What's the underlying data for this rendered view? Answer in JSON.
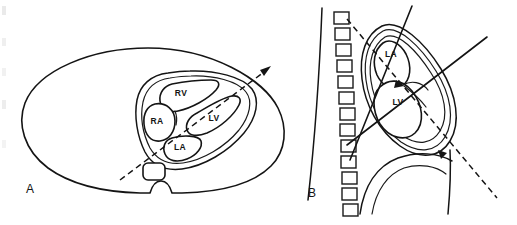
{
  "figure": {
    "width": 517,
    "height": 225,
    "background": "#ffffff",
    "ink_color": "#141414"
  },
  "panels": [
    {
      "id": "A",
      "label": "A",
      "label_x": 30,
      "label_y": 190,
      "view": "transverse thoracic cross-section",
      "chambers": [
        {
          "abbr": "RV",
          "x": 181,
          "y": 94
        },
        {
          "abbr": "RA",
          "x": 157,
          "y": 122
        },
        {
          "abbr": "LV",
          "x": 214,
          "y": 119
        },
        {
          "abbr": "LA",
          "x": 180,
          "y": 148
        }
      ],
      "structures": [
        "body-wall-outline",
        "pericardial-outline",
        "descending-aorta",
        "spine-notch"
      ],
      "scan_plane": {
        "type": "dashed",
        "from_x": 120,
        "from_y": 180,
        "to_x": 272,
        "to_y": 66,
        "has_arrowhead": true
      }
    },
    {
      "id": "B",
      "label": "B",
      "label_x": 312,
      "label_y": 194,
      "view": "sagittal / parasternal long-axis",
      "chambers": [
        {
          "abbr": "LA",
          "x": 391,
          "y": 55
        },
        {
          "abbr": "LV",
          "x": 398,
          "y": 103
        }
      ],
      "structures": [
        "chest-wall-line",
        "vertebral-column",
        "pericardial-outline",
        "mitral-valve",
        "diaphragm-curve"
      ],
      "vertebra_count": 13,
      "scan_plane": {
        "type": "dashed",
        "from_x": 345,
        "from_y": 18,
        "to_x": 500,
        "to_y": 200,
        "has_arrowhead": true
      },
      "beam_lines": [
        {
          "from_x": 412,
          "from_y": 6,
          "to_x": 350,
          "to_y": 160
        },
        {
          "from_x": 486,
          "from_y": 38,
          "to_x": 348,
          "to_y": 144
        }
      ]
    }
  ],
  "legend": {
    "abbreviations": [
      {
        "abbr": "RV",
        "meaning": "right ventricle"
      },
      {
        "abbr": "RA",
        "meaning": "right atrium"
      },
      {
        "abbr": "LV",
        "meaning": "left ventricle"
      },
      {
        "abbr": "LA",
        "meaning": "left atrium"
      }
    ]
  }
}
